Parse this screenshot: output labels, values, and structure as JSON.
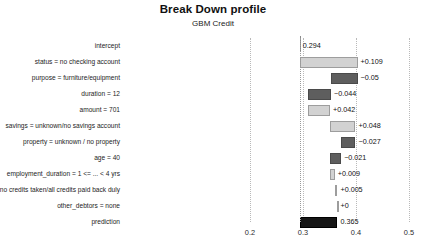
{
  "header": {
    "title": "Break Down profile",
    "subtitle": "GBM Credit"
  },
  "chart_data": {
    "type": "bar",
    "subtype": "waterfall-breakdown",
    "title": "Break Down profile",
    "subtitle": "GBM Credit",
    "xlabel": "",
    "ylabel": "",
    "xlim": [
      0.155,
      0.52
    ],
    "ticks": [
      0.2,
      0.3,
      0.4,
      0.5
    ],
    "tick_labels": [
      "0.2",
      "0.3",
      "0.4",
      "0.5"
    ],
    "grid": true,
    "reference_line": 0.294,
    "categories": [
      "intercept",
      "status = no checking account",
      "purpose = furniture/equipment",
      "duration = 12",
      "amount = 701",
      "savings = unknown/no savings account",
      "property = unknown / no property",
      "age = 40",
      "employment_duration = 1 <= ... < 4 yrs",
      "credit_history = no credits taken/all credits paid back duly",
      "other_debtors = none",
      "prediction"
    ],
    "bars": [
      {
        "label": "intercept",
        "kind": "intercept",
        "value": 0.294,
        "display": "0.294",
        "start": 0.294,
        "end": 0.294
      },
      {
        "label": "status = no checking account",
        "kind": "positive",
        "value": 0.109,
        "display": "+0.109",
        "start": 0.294,
        "end": 0.403
      },
      {
        "label": "purpose = furniture/equipment",
        "kind": "negative",
        "value": -0.05,
        "display": "−0.05",
        "start": 0.403,
        "end": 0.353
      },
      {
        "label": "duration = 12",
        "kind": "negative",
        "value": -0.044,
        "display": "−0.044",
        "start": 0.353,
        "end": 0.309
      },
      {
        "label": "amount = 701",
        "kind": "positive",
        "value": 0.042,
        "display": "+0.042",
        "start": 0.309,
        "end": 0.351
      },
      {
        "label": "savings = unknown/no savings account",
        "kind": "positive",
        "value": 0.048,
        "display": "+0.048",
        "start": 0.351,
        "end": 0.399
      },
      {
        "label": "property = unknown / no property",
        "kind": "negative",
        "value": -0.027,
        "display": "−0.027",
        "start": 0.399,
        "end": 0.372
      },
      {
        "label": "age = 40",
        "kind": "negative",
        "value": -0.021,
        "display": "−0.021",
        "start": 0.372,
        "end": 0.351
      },
      {
        "label": "employment_duration = 1 <= ... < 4 yrs",
        "kind": "positive",
        "value": 0.009,
        "display": "+0.009",
        "start": 0.351,
        "end": 0.36
      },
      {
        "label": "credit_history = no credits taken/all credits paid back duly",
        "kind": "positive",
        "value": 0.005,
        "display": "+0.005",
        "start": 0.36,
        "end": 0.365
      },
      {
        "label": "other_debtors = none",
        "kind": "positive",
        "value": 0.0,
        "display": "+0",
        "start": 0.365,
        "end": 0.365
      },
      {
        "label": "prediction",
        "kind": "total",
        "value": 0.365,
        "display": "0.365",
        "start": 0.294,
        "end": 0.365
      }
    ]
  },
  "colors": {
    "positive": "#d2d2d2",
    "negative": "#5e5e5e",
    "total": "#161616",
    "grid": "#b9b9b9",
    "text": "#1a1a1a"
  }
}
